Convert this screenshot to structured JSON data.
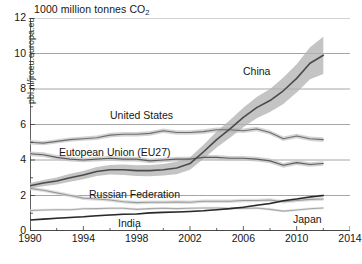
{
  "chart_data": {
    "type": "line",
    "title": "1000 million tonnes CO2",
    "title_main": "1000 million tonnes CO",
    "title_sub": "2",
    "xlabel": "",
    "ylabel": "",
    "xlim": [
      1990,
      2014
    ],
    "ylim": [
      0,
      12
    ],
    "grid": "horizontal",
    "legend_position": "inline-labels",
    "xticks": [
      "1990",
      "1994",
      "1998",
      "2002",
      "2006",
      "2010",
      "2014"
    ],
    "xtick_values": [
      1990,
      1994,
      1998,
      2002,
      2006,
      2010,
      2014
    ],
    "yticks": [
      "0",
      "2",
      "4",
      "6",
      "8",
      "10",
      "12"
    ],
    "ytick_values": [
      0,
      2,
      4,
      6,
      8,
      10,
      12
    ],
    "yminor_values": [
      1,
      3,
      5,
      7,
      9,
      11
    ],
    "x": [
      1990,
      1991,
      1992,
      1993,
      1994,
      1995,
      1996,
      1997,
      1998,
      1999,
      2000,
      2001,
      2002,
      2003,
      2004,
      2005,
      2006,
      2007,
      2008,
      2009,
      2010,
      2011,
      2012
    ],
    "series": [
      {
        "name": "China",
        "color": "#4a4a4a",
        "band_color": "#b0b0b0",
        "label": "China",
        "values": [
          2.55,
          2.7,
          2.82,
          3.0,
          3.15,
          3.35,
          3.45,
          3.45,
          3.4,
          3.4,
          3.45,
          3.55,
          3.8,
          4.45,
          5.15,
          5.75,
          6.4,
          6.95,
          7.35,
          7.9,
          8.6,
          9.45,
          9.9
        ],
        "band_low": [
          2.4,
          2.52,
          2.62,
          2.78,
          2.92,
          3.1,
          3.18,
          3.16,
          3.1,
          3.08,
          3.12,
          3.2,
          3.45,
          4.05,
          4.7,
          5.25,
          5.85,
          6.35,
          6.7,
          7.15,
          7.8,
          8.55,
          8.85
        ],
        "band_high": [
          2.7,
          2.88,
          3.02,
          3.22,
          3.38,
          3.6,
          3.72,
          3.74,
          3.7,
          3.72,
          3.78,
          3.9,
          4.15,
          4.85,
          5.6,
          6.25,
          6.95,
          7.55,
          8.0,
          8.65,
          9.4,
          10.35,
          10.95
        ]
      },
      {
        "name": "United States",
        "color": "#6d6d6d",
        "band_color": "#c6c6c6",
        "label": "United States",
        "values": [
          5.0,
          4.95,
          5.05,
          5.15,
          5.2,
          5.25,
          5.4,
          5.45,
          5.45,
          5.5,
          5.65,
          5.55,
          5.55,
          5.6,
          5.7,
          5.7,
          5.65,
          5.75,
          5.55,
          5.2,
          5.35,
          5.2,
          5.15
        ],
        "band_low": [
          4.88,
          4.83,
          4.93,
          5.03,
          5.08,
          5.12,
          5.27,
          5.32,
          5.32,
          5.37,
          5.52,
          5.42,
          5.42,
          5.47,
          5.57,
          5.57,
          5.52,
          5.62,
          5.42,
          5.07,
          5.22,
          5.07,
          5.02
        ],
        "band_high": [
          5.12,
          5.07,
          5.17,
          5.27,
          5.32,
          5.38,
          5.53,
          5.58,
          5.58,
          5.63,
          5.78,
          5.68,
          5.68,
          5.73,
          5.83,
          5.83,
          5.78,
          5.88,
          5.68,
          5.33,
          5.48,
          5.33,
          5.28
        ]
      },
      {
        "name": "European Union (EU27)",
        "color": "#5c5c5c",
        "band_color": "#c2c2c2",
        "label": "Eutopean Union (EU27)",
        "values": [
          4.35,
          4.3,
          4.15,
          4.05,
          4.0,
          4.05,
          4.1,
          4.05,
          4.05,
          3.95,
          4.0,
          4.05,
          4.05,
          4.15,
          4.15,
          4.1,
          4.1,
          4.05,
          3.95,
          3.7,
          3.85,
          3.75,
          3.8
        ],
        "band_low": [
          4.22,
          4.17,
          4.02,
          3.92,
          3.87,
          3.92,
          3.97,
          3.92,
          3.92,
          3.82,
          3.87,
          3.92,
          3.92,
          4.02,
          4.02,
          3.97,
          3.97,
          3.92,
          3.82,
          3.57,
          3.72,
          3.62,
          3.67
        ],
        "band_high": [
          4.48,
          4.43,
          4.28,
          4.18,
          4.13,
          4.18,
          4.23,
          4.18,
          4.18,
          4.08,
          4.13,
          4.18,
          4.18,
          4.28,
          4.28,
          4.23,
          4.23,
          4.18,
          4.08,
          3.83,
          3.98,
          3.88,
          3.93
        ]
      },
      {
        "name": "Russian Federation",
        "color": "#9a9a9a",
        "band_color": "#d4d4d4",
        "label": "Russian Federation",
        "values": [
          2.4,
          2.3,
          2.15,
          2.0,
          1.85,
          1.8,
          1.75,
          1.65,
          1.6,
          1.62,
          1.62,
          1.63,
          1.62,
          1.68,
          1.68,
          1.68,
          1.72,
          1.72,
          1.75,
          1.65,
          1.72,
          1.78,
          1.8
        ],
        "band_low": [
          2.3,
          2.2,
          2.05,
          1.9,
          1.75,
          1.7,
          1.65,
          1.55,
          1.5,
          1.52,
          1.52,
          1.53,
          1.52,
          1.58,
          1.58,
          1.58,
          1.62,
          1.62,
          1.65,
          1.55,
          1.62,
          1.68,
          1.7
        ],
        "band_high": [
          2.5,
          2.4,
          2.25,
          2.1,
          1.95,
          1.9,
          1.85,
          1.75,
          1.7,
          1.72,
          1.72,
          1.73,
          1.72,
          1.78,
          1.78,
          1.78,
          1.82,
          1.82,
          1.85,
          1.75,
          1.82,
          1.88,
          1.9
        ]
      },
      {
        "name": "India",
        "color": "#2a2a2a",
        "band_color": "#c9c9c9",
        "label": "India",
        "values": [
          0.62,
          0.67,
          0.72,
          0.76,
          0.8,
          0.86,
          0.9,
          0.94,
          0.96,
          1.02,
          1.05,
          1.07,
          1.1,
          1.14,
          1.2,
          1.26,
          1.34,
          1.45,
          1.55,
          1.7,
          1.8,
          1.92,
          2.0
        ],
        "band_low": [
          0.58,
          0.63,
          0.68,
          0.72,
          0.76,
          0.82,
          0.86,
          0.9,
          0.92,
          0.98,
          1.01,
          1.03,
          1.06,
          1.1,
          1.16,
          1.22,
          1.3,
          1.4,
          1.5,
          1.64,
          1.74,
          1.86,
          1.93
        ],
        "band_high": [
          0.66,
          0.71,
          0.76,
          0.8,
          0.84,
          0.9,
          0.94,
          0.98,
          1.0,
          1.06,
          1.09,
          1.11,
          1.14,
          1.18,
          1.24,
          1.3,
          1.38,
          1.5,
          1.6,
          1.76,
          1.86,
          1.98,
          2.07
        ]
      },
      {
        "name": "Japan",
        "color": "#a8a8a8",
        "band_color": "#dcdcdc",
        "label": "Japan",
        "values": [
          1.15,
          1.18,
          1.2,
          1.2,
          1.25,
          1.26,
          1.28,
          1.28,
          1.22,
          1.26,
          1.28,
          1.26,
          1.28,
          1.3,
          1.3,
          1.28,
          1.27,
          1.3,
          1.22,
          1.12,
          1.18,
          1.25,
          1.3
        ],
        "band_low": [
          1.08,
          1.11,
          1.13,
          1.13,
          1.18,
          1.19,
          1.21,
          1.21,
          1.15,
          1.19,
          1.21,
          1.19,
          1.21,
          1.23,
          1.23,
          1.21,
          1.2,
          1.23,
          1.15,
          1.05,
          1.11,
          1.18,
          1.23
        ],
        "band_high": [
          1.22,
          1.25,
          1.27,
          1.27,
          1.32,
          1.33,
          1.35,
          1.35,
          1.29,
          1.33,
          1.35,
          1.33,
          1.35,
          1.37,
          1.37,
          1.35,
          1.34,
          1.37,
          1.29,
          1.19,
          1.25,
          1.32,
          1.37
        ]
      }
    ]
  },
  "watermark": {
    "text": "pbl.nl/jrceu.europa.eu"
  },
  "caption": {
    "text": ""
  }
}
